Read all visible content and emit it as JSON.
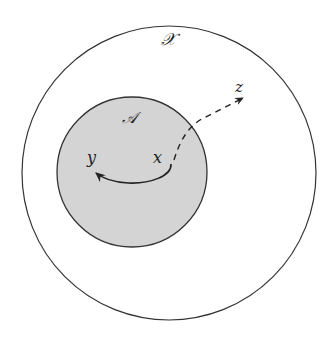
{
  "diagram": {
    "outer_set": {
      "label": "𝒳",
      "fill": "#ffffff",
      "stroke": "#333333"
    },
    "inner_set": {
      "label": "𝒜",
      "fill": "#d4d4d4",
      "stroke": "#333333"
    },
    "points": {
      "x": "x",
      "y": "y",
      "z": "z"
    },
    "arrows": [
      {
        "from": "x",
        "to": "y",
        "style": "solid"
      },
      {
        "from": "x",
        "to": "z",
        "style": "dashed"
      }
    ]
  }
}
